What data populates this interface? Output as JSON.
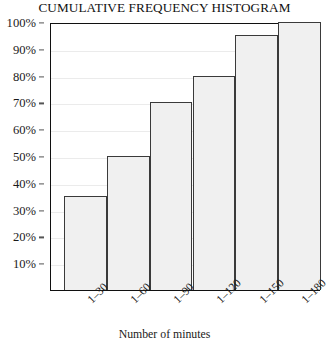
{
  "chart_data": {
    "type": "bar",
    "title": "CUMULATIVE FREQUENCY HISTOGRAM",
    "xlabel": "Number of minutes",
    "ylabel": "",
    "categories": [
      "1–30",
      "1–60",
      "1–90",
      "1–120",
      "1–150",
      "1–180"
    ],
    "values": [
      35,
      50,
      70,
      80,
      95,
      100
    ],
    "ylim": [
      0,
      100
    ],
    "y_ticks": [
      10,
      20,
      30,
      40,
      50,
      60,
      70,
      80,
      90,
      100
    ],
    "y_tick_labels": [
      "10%",
      "20%",
      "30%",
      "40%",
      "50%",
      "60%",
      "70%",
      "80%",
      "90%",
      "100%"
    ],
    "value_suffix": "%",
    "grid": true,
    "grid_axis": "y",
    "legend": false,
    "legend_position": "none",
    "bar_fill_color": "#f0f0f0",
    "bar_border_color": "#3a3a3a",
    "gridline_color": "#ebebeb",
    "axis_color": "#101010",
    "text_color": "#1a1a1a",
    "background_color": "#ffffff",
    "x_tick_label_rotation": -45
  }
}
